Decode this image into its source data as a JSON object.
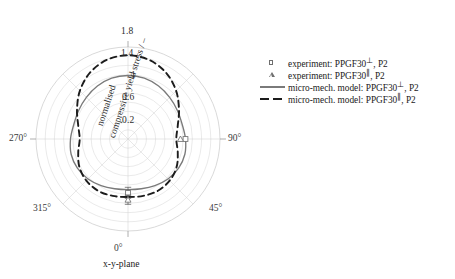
{
  "chart_data": {
    "type": "line",
    "plot_kind": "polar",
    "title": "",
    "caption": "x-y-plane",
    "radial_axis_label": "normalised compressive yield stress / –",
    "radial_axis_label_line1": "normalised",
    "radial_axis_label_line2": "compressive yield stress / –",
    "radial_ticks": [
      0.2,
      0.6,
      1,
      1.4,
      1.8
    ],
    "radial_tick_labels": [
      "0.2",
      "0.6",
      "1",
      "1.4",
      "1.8"
    ],
    "rlim": [
      0,
      2.0
    ],
    "angular_tick_labels": [
      "0°",
      "45°",
      "90°",
      "270°",
      "315°"
    ],
    "angular_ticks_deg": [
      0,
      45,
      90,
      270,
      315
    ],
    "grid": true,
    "legend_position": "right",
    "series": [
      {
        "name": "micro-mech. model: PPGF30⊥, P2",
        "style": "solid",
        "color": "#7a7a7a",
        "theta_deg": [
          0,
          15,
          30,
          45,
          60,
          75,
          90,
          105,
          120,
          135,
          150,
          165,
          180,
          195,
          210,
          225,
          240,
          255,
          270,
          285,
          300,
          315,
          330,
          345
        ],
        "values": [
          1.1,
          1.12,
          1.17,
          1.23,
          1.27,
          1.28,
          1.25,
          1.22,
          1.24,
          1.28,
          1.33,
          1.37,
          1.38,
          1.37,
          1.33,
          1.28,
          1.24,
          1.22,
          1.25,
          1.28,
          1.27,
          1.23,
          1.17,
          1.12
        ]
      },
      {
        "name": "micro-mech. model: PPGF30∥, P2",
        "style": "dashed",
        "color": "#1c1c1c",
        "theta_deg": [
          0,
          15,
          30,
          45,
          60,
          75,
          90,
          105,
          120,
          135,
          150,
          165,
          180,
          195,
          210,
          225,
          240,
          255,
          270,
          285,
          300,
          315,
          330,
          345
        ],
        "values": [
          1.26,
          1.28,
          1.3,
          1.28,
          1.22,
          1.12,
          1.05,
          1.12,
          1.28,
          1.48,
          1.66,
          1.78,
          1.82,
          1.78,
          1.66,
          1.48,
          1.28,
          1.12,
          1.05,
          1.12,
          1.22,
          1.28,
          1.3,
          1.28
        ]
      }
    ],
    "experiment_points": [
      {
        "name": "experiment: PPGF30⊥, P2",
        "marker": "square",
        "theta_deg": 0,
        "value": 1.17,
        "error": 0.12
      },
      {
        "name": "experiment: PPGF30∥, P2",
        "marker": "triangle",
        "theta_deg": 0,
        "value": 1.32,
        "error": 0.1
      },
      {
        "name": "experiment: PPGF30⊥, P2",
        "marker": "square",
        "theta_deg": 90,
        "value": 1.25,
        "error": 0.0
      },
      {
        "name": "experiment: PPGF30∥, P2",
        "marker": "triangle",
        "theta_deg": 90,
        "value": 1.14,
        "error": 0.0
      }
    ]
  },
  "axis": {
    "radial_title_line1": "normalised",
    "radial_title_line2": "compressive yield stress / –",
    "tick_0_2": "0.2",
    "tick_0_6": "0.6",
    "tick_1": "1",
    "tick_1_4": "1.4",
    "tick_1_8": "1.8",
    "angle_0": "0°",
    "angle_45": "45°",
    "angle_90": "90°",
    "angle_270": "270°",
    "angle_315": "315°"
  },
  "caption": {
    "text": "x-y-plane"
  },
  "legend": {
    "rows": [
      {
        "key": "square-marker",
        "label_pre": "experiment: PPGF30",
        "sup": "⊥",
        "label_post": ", P2"
      },
      {
        "key": "triangle-marker",
        "label_pre": "experiment: PPGF30",
        "sup": "∥",
        "label_post": ", P2"
      },
      {
        "key": "solid-line",
        "label_pre": "micro-mech. model: PPGF30",
        "sup": "⊥",
        "label_post": ", P2"
      },
      {
        "key": "dashed-line",
        "label_pre": "micro-mech. model: PPGF30",
        "sup": "∥",
        "label_post": ", P2"
      }
    ]
  },
  "colors": {
    "solid_curve": "#7a7a7a",
    "dashed_curve": "#1c1c1c",
    "grid": "#d2d2d2",
    "marker_edge": "#6f6f6f"
  }
}
